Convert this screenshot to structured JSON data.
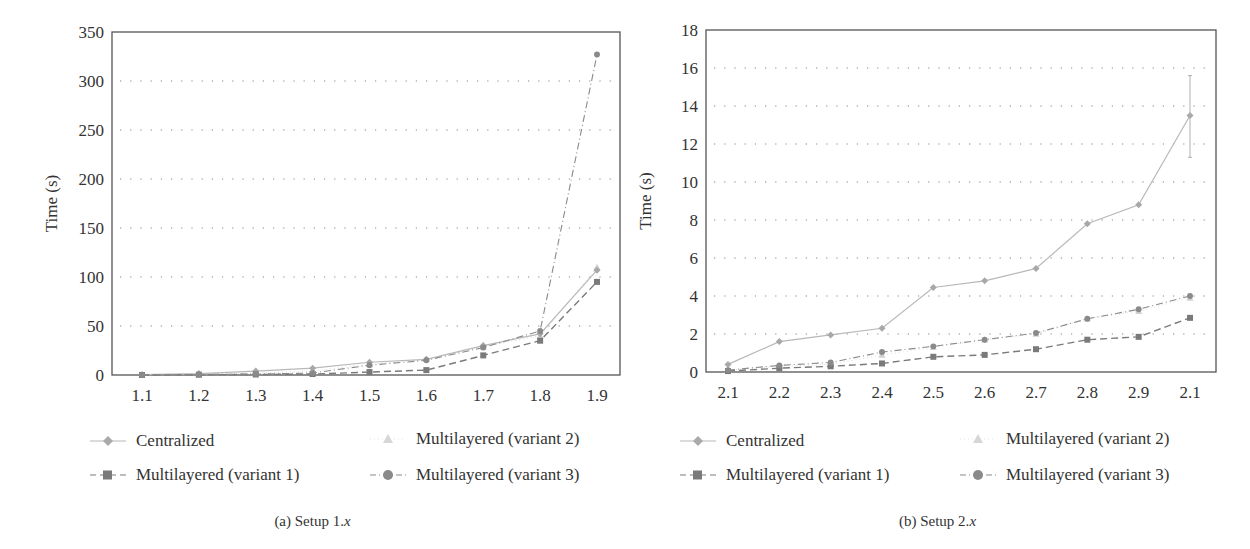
{
  "legend": {
    "centralized": "Centralized",
    "variant1": "Multilayered (variant 1)",
    "variant2": "Multilayered (variant 2)",
    "variant3": "Multilayered (variant 3)"
  },
  "colors": {
    "centralized": "#b8b8b8",
    "variant1": "#7a7a7a",
    "variant2": "#d6d6d6",
    "variant3": "#8a8a8a",
    "axis": "#444444",
    "grid": "#888888"
  },
  "chart_data": [
    {
      "type": "line",
      "title": "(a) Setup 1.x",
      "caption_prefix": "(a)  Setup 1.",
      "caption_var": "x",
      "xlabel": "",
      "ylabel": "Time (s)",
      "categories": [
        "1.1",
        "1.2",
        "1.3",
        "1.4",
        "1.5",
        "1.6",
        "1.7",
        "1.8",
        "1.9"
      ],
      "ylim": [
        0,
        350
      ],
      "yticks": [
        0,
        50,
        100,
        150,
        200,
        250,
        300,
        350
      ],
      "grid": "horizontal-dotted",
      "legend_position": "bottom",
      "series": [
        {
          "name": "Centralized",
          "marker": "diamond",
          "line": "solid",
          "values": [
            0.5,
            1.5,
            4,
            7,
            13,
            16,
            30,
            42,
            107
          ]
        },
        {
          "name": "Multilayered (variant 1)",
          "marker": "square",
          "line": "dashed",
          "values": [
            0,
            0.3,
            0.5,
            1,
            3,
            5,
            20,
            35,
            95
          ]
        },
        {
          "name": "Multilayered (variant 2)",
          "marker": "triangle",
          "line": "dotted",
          "values": [
            0.3,
            1,
            2,
            4,
            11,
            16,
            29,
            40,
            110
          ]
        },
        {
          "name": "Multilayered (variant 3)",
          "marker": "circle",
          "line": "dashdot",
          "values": [
            0.1,
            0.5,
            1,
            2,
            10,
            15,
            28,
            45,
            327
          ]
        }
      ]
    },
    {
      "type": "line",
      "title": "(b) Setup 2.x",
      "caption_prefix": "(b)  Setup 2.",
      "caption_var": "x",
      "xlabel": "",
      "ylabel": "Time (s)",
      "categories": [
        "2.1",
        "2.2",
        "2.3",
        "2.4",
        "2.5",
        "2.6",
        "2.7",
        "2.8",
        "2.9",
        "2.1"
      ],
      "ylim": [
        0,
        18
      ],
      "yticks": [
        0,
        2,
        4,
        6,
        8,
        10,
        12,
        14,
        16,
        18
      ],
      "grid": "horizontal-dotted",
      "legend_position": "bottom",
      "error_bars": {
        "Centralized_last": [
          11.3,
          15.6
        ]
      },
      "series": [
        {
          "name": "Centralized",
          "marker": "diamond",
          "line": "solid",
          "values": [
            0.4,
            1.6,
            1.95,
            2.3,
            4.45,
            4.8,
            5.45,
            7.8,
            8.8,
            13.5
          ]
        },
        {
          "name": "Multilayered (variant 1)",
          "marker": "square",
          "line": "dashed",
          "values": [
            0.05,
            0.2,
            0.3,
            0.45,
            0.8,
            0.9,
            1.2,
            1.7,
            1.85,
            2.85
          ]
        },
        {
          "name": "Multilayered (variant 2)",
          "marker": "triangle",
          "line": "dotted",
          "values": [
            0.1,
            0.3,
            0.4,
            0.9,
            1.3,
            1.7,
            2.0,
            2.8,
            3.2,
            3.9
          ]
        },
        {
          "name": "Multilayered (variant 3)",
          "marker": "circle",
          "line": "dashdot",
          "values": [
            0.1,
            0.35,
            0.5,
            1.05,
            1.35,
            1.7,
            2.05,
            2.8,
            3.3,
            4.0
          ]
        }
      ]
    }
  ]
}
